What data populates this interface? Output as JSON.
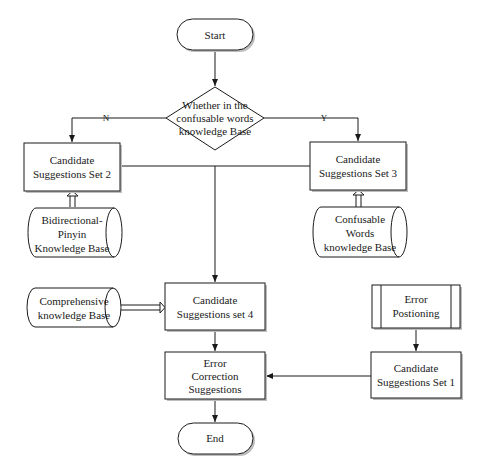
{
  "diagram": {
    "type": "flowchart",
    "colors": {
      "stroke": "#1a1a1a",
      "fill": "#ffffff",
      "background": "#ffffff",
      "shadow": "#bdbdbd"
    },
    "nodes": {
      "start": {
        "shape": "terminator",
        "lines": [
          "Start"
        ]
      },
      "decision": {
        "shape": "diamond",
        "lines": [
          "Whether in the",
          "confusable words",
          "knowledge Base"
        ]
      },
      "set2": {
        "shape": "process",
        "lines": [
          "Candidate",
          "Suggestions Set 2"
        ]
      },
      "set3": {
        "shape": "process",
        "lines": [
          "Candidate",
          "Suggestions Set 3"
        ]
      },
      "pinyin_kb": {
        "shape": "database",
        "lines": [
          "Bidirectional-",
          "Pinyin",
          "Knowledge Base"
        ]
      },
      "confusable_kb": {
        "shape": "database",
        "lines": [
          "Confusable",
          "Words",
          "knowledge Base"
        ]
      },
      "comprehensive_kb": {
        "shape": "database",
        "lines": [
          "Comprehensive",
          "knowledge Base"
        ]
      },
      "set4": {
        "shape": "process",
        "lines": [
          "Candidate",
          "Suggestions set 4"
        ]
      },
      "error_pos": {
        "shape": "predefined-process",
        "lines": [
          "Error",
          "Postioning"
        ]
      },
      "set1": {
        "shape": "process",
        "lines": [
          "Candidate",
          "Suggestions Set 1"
        ]
      },
      "correction": {
        "shape": "process",
        "lines": [
          "Error",
          "Correction",
          "Suggestions"
        ]
      },
      "end": {
        "shape": "terminator",
        "lines": [
          "End"
        ]
      }
    },
    "edge_labels": {
      "no": "N",
      "yes": "Y"
    },
    "edges": [
      {
        "from": "start",
        "to": "decision"
      },
      {
        "from": "decision",
        "to": "set2",
        "label": "N"
      },
      {
        "from": "decision",
        "to": "set3",
        "label": "Y"
      },
      {
        "from": "pinyin_kb",
        "to": "set2",
        "style": "double"
      },
      {
        "from": "confusable_kb",
        "to": "set3",
        "style": "double"
      },
      {
        "from": "set2",
        "to": "set4"
      },
      {
        "from": "set3",
        "to": "set4"
      },
      {
        "from": "comprehensive_kb",
        "to": "set4",
        "style": "double"
      },
      {
        "from": "set4",
        "to": "correction"
      },
      {
        "from": "error_pos",
        "to": "set1"
      },
      {
        "from": "set1",
        "to": "correction"
      },
      {
        "from": "correction",
        "to": "end"
      }
    ]
  }
}
